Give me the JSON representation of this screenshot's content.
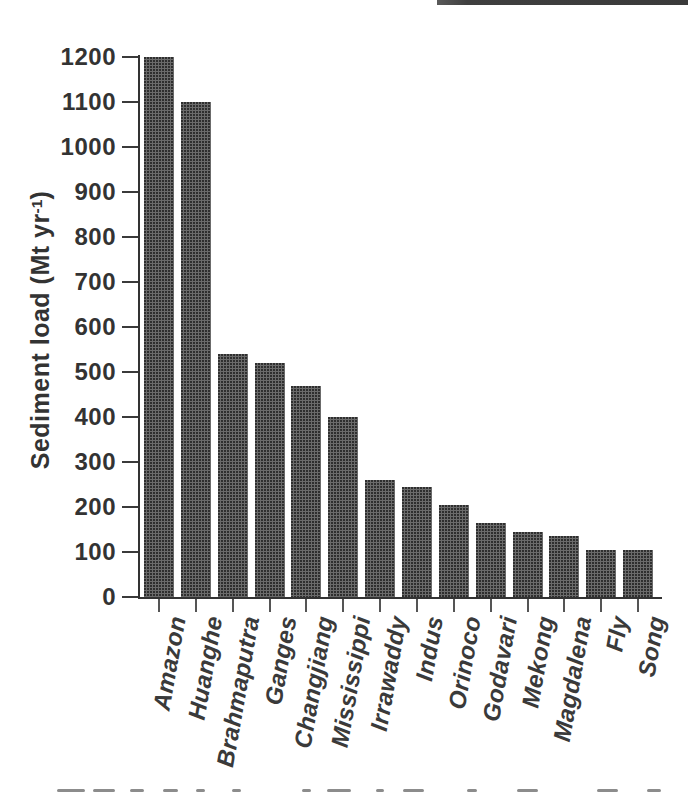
{
  "chart_data": {
    "type": "bar",
    "title": "",
    "categories": [
      "Amazon",
      "Huanghe",
      "Brahmaputra",
      "Ganges",
      "Changjiang",
      "Mississippi",
      "Irrawaddy",
      "Indus",
      "Orinoco",
      "Godavari",
      "Mekong",
      "Magdalena",
      "Fly",
      "Song"
    ],
    "values": [
      1200,
      1100,
      540,
      520,
      470,
      400,
      260,
      245,
      205,
      165,
      145,
      135,
      105,
      105
    ],
    "ylabel": "Sediment load (Mt yr-1)",
    "ylabel_parts": {
      "prefix": "Sediment load (Mt yr",
      "superscript": "-1",
      "suffix": ")"
    },
    "xlabel": "",
    "ylim": [
      0,
      1200
    ],
    "ytick_step": 100,
    "ytick_labels": [
      "0",
      "100",
      "200",
      "300",
      "400",
      "500",
      "600",
      "700",
      "800",
      "900",
      "1000",
      "1100",
      "1200"
    ],
    "grid": false,
    "legend_position": "none",
    "bar_color": "#5f5f5f",
    "axis_color": "#333333",
    "text_color": "#3a3a3a",
    "x_labels_italic": true
  },
  "scan_artifacts": {
    "top_right_stripe_color": "#3f3f3f",
    "caption_cut_off": true,
    "caption_marks": [
      [
        57,
        28
      ],
      [
        93,
        22
      ],
      [
        130,
        14
      ],
      [
        163,
        15
      ],
      [
        196,
        9
      ],
      [
        232,
        9
      ],
      [
        302,
        9
      ],
      [
        327,
        24
      ],
      [
        376,
        8
      ],
      [
        403,
        21
      ],
      [
        467,
        10
      ],
      [
        517,
        21
      ],
      [
        597,
        21
      ],
      [
        647,
        14
      ]
    ]
  }
}
